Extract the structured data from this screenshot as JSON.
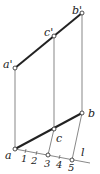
{
  "diagram": {
    "labels": {
      "a_prime": "a'",
      "c_prime": "c'",
      "b_prime": "b'",
      "a": "a",
      "c": "c",
      "b": "b",
      "l": "l"
    },
    "divisions": [
      "1",
      "2",
      "3",
      "4",
      "5"
    ],
    "colors": {
      "line": "#222222",
      "thin": "#555555",
      "point_fill": "#ffffff"
    }
  }
}
